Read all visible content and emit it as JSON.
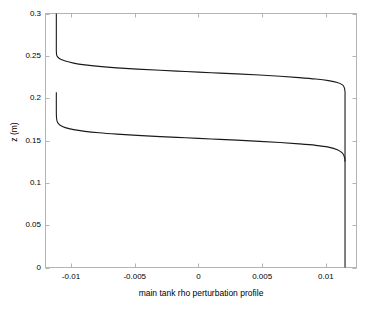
{
  "chart_data": {
    "type": "line",
    "title": "",
    "xlabel": "main tank rho perturbation profile",
    "ylabel": "z (m)",
    "xlim": [
      -0.012,
      0.0124
    ],
    "ylim": [
      0,
      0.3
    ],
    "grid": false,
    "legend": null,
    "xticks": [
      -0.01,
      -0.005,
      0,
      0.005,
      0.01
    ],
    "xtick_labels": [
      "-0.01",
      "-0.005",
      "0",
      "0.005",
      "0.01"
    ],
    "yticks": [
      0,
      0.05,
      0.1,
      0.15,
      0.2,
      0.25,
      0.3
    ],
    "ytick_labels": [
      "0",
      "0.05",
      "0.1",
      "0.15",
      "0.2",
      "0.25",
      "0.3"
    ],
    "line_color": "#1a1a1a",
    "axis_color": "#b4b4b4",
    "background": "#ffffff",
    "series": [
      {
        "name": "upper interface profile",
        "comment": "rho perturbation vs z; sharp transition centred near z=0.225",
        "points": [
          [
            -0.01115,
            0.3
          ],
          [
            -0.01115,
            0.268
          ],
          [
            -0.01115,
            0.256
          ],
          [
            -0.01113,
            0.2515
          ],
          [
            -0.01105,
            0.2487
          ],
          [
            -0.01085,
            0.2462
          ],
          [
            -0.01045,
            0.2438
          ],
          [
            -0.0098,
            0.2414
          ],
          [
            -0.0089,
            0.2393
          ],
          [
            -0.0078,
            0.2375
          ],
          [
            -0.0064,
            0.2358
          ],
          [
            -0.0048,
            0.2343
          ],
          [
            -0.003,
            0.2329
          ],
          [
            -0.001,
            0.2315
          ],
          [
            0.001,
            0.2301
          ],
          [
            0.003,
            0.2287
          ],
          [
            0.0048,
            0.2273
          ],
          [
            0.0064,
            0.2259
          ],
          [
            0.0079,
            0.2243
          ],
          [
            0.0092,
            0.2226
          ],
          [
            0.0102,
            0.2207
          ],
          [
            0.0109,
            0.2185
          ],
          [
            0.0113,
            0.2157
          ],
          [
            0.01145,
            0.212
          ],
          [
            0.0115,
            0.207
          ],
          [
            0.0115,
            0.2
          ],
          [
            0.0115,
            0.15
          ],
          [
            0.0115,
            0.125
          ]
        ]
      },
      {
        "name": "lower interface profile",
        "comment": "rho perturbation vs z; sharp transition centred near z=0.148",
        "points": [
          [
            -0.01115,
            0.207
          ],
          [
            -0.01115,
            0.184
          ],
          [
            -0.01113,
            0.176
          ],
          [
            -0.01105,
            0.1712
          ],
          [
            -0.01085,
            0.168
          ],
          [
            -0.01045,
            0.1652
          ],
          [
            -0.0098,
            0.1628
          ],
          [
            -0.0089,
            0.1608
          ],
          [
            -0.0078,
            0.1591
          ],
          [
            -0.0064,
            0.1575
          ],
          [
            -0.0048,
            0.156
          ],
          [
            -0.003,
            0.1546
          ],
          [
            -0.001,
            0.1532
          ],
          [
            0.001,
            0.1518
          ],
          [
            0.003,
            0.1504
          ],
          [
            0.0048,
            0.149
          ],
          [
            0.0064,
            0.1476
          ],
          [
            0.0079,
            0.146
          ],
          [
            0.0092,
            0.1443
          ],
          [
            0.0102,
            0.1422
          ],
          [
            0.0109,
            0.1392
          ],
          [
            0.0113,
            0.135
          ],
          [
            0.01147,
            0.1295
          ],
          [
            0.0115,
            0.123
          ],
          [
            0.0115,
            0.1
          ],
          [
            0.0115,
            0.05
          ],
          [
            0.0115,
            0.0
          ]
        ]
      }
    ]
  },
  "axes": {
    "xlabel": "main tank rho perturbation profile",
    "ylabel": "z (m)"
  }
}
